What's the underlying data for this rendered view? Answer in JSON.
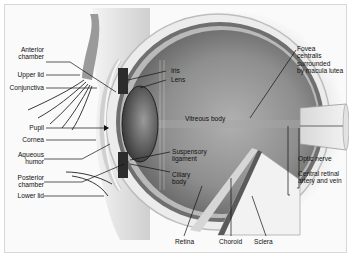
{
  "diagram": {
    "labels_left": [
      {
        "id": "anterior-chamber",
        "text": "Anterior\nchamber"
      },
      {
        "id": "upper-lid",
        "text": "Upper lid"
      },
      {
        "id": "conjunctiva",
        "text": "Conjunctiva"
      },
      {
        "id": "pupil",
        "text": "Pupil"
      },
      {
        "id": "cornea",
        "text": "Cornea"
      },
      {
        "id": "aqueous-humor",
        "text": "Aqueous\nhumor"
      },
      {
        "id": "posterior-chamber",
        "text": "Posterior\nchamber"
      },
      {
        "id": "lower-lid",
        "text": "Lower lid"
      }
    ],
    "labels_center": [
      {
        "id": "iris",
        "text": "Iris"
      },
      {
        "id": "lens",
        "text": "Lens"
      },
      {
        "id": "vitreous-body",
        "text": "Vitreous body"
      },
      {
        "id": "suspensory-ligament",
        "text": "Suspensory\nligament"
      },
      {
        "id": "ciliary-body",
        "text": "Ciliary\nbody"
      }
    ],
    "labels_right": [
      {
        "id": "fovea",
        "text": "Fovea\ncentralis\nsurrounded\nby macula lutea"
      },
      {
        "id": "optic-nerve",
        "text": "Optic nerve"
      },
      {
        "id": "central-retinal",
        "text": "Central retinal\nartery and vein"
      }
    ],
    "labels_bottom": [
      {
        "id": "retina",
        "text": "Retina"
      },
      {
        "id": "choroid",
        "text": "Choroid"
      },
      {
        "id": "sclera",
        "text": "Sclera"
      }
    ],
    "colors": {
      "background": "#fafafa",
      "sclera": "#e9e9e9",
      "vitreous": "#8a8a8a",
      "lens": "#5a5a5a",
      "leader_line": "#111111"
    }
  }
}
